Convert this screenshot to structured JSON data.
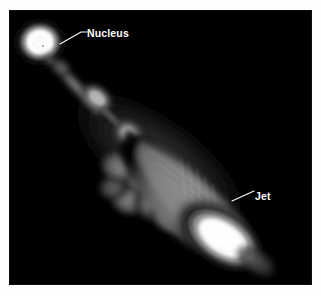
{
  "figure": {
    "kind": "radio-astronomy-image",
    "background_color": "#ffffff",
    "plate_color": "#000000",
    "annotation_color": "#ffffff"
  },
  "annotations": [
    {
      "id": "nucleus",
      "label": "Nucleus",
      "leader_from_x": 51,
      "leader_from_y": 34,
      "leader_to_x": 76,
      "leader_to_y": 21
    },
    {
      "id": "jet",
      "label": "Jet",
      "leader_from_x": 223,
      "leader_from_y": 191,
      "leader_to_x": 244,
      "leader_to_y": 181
    }
  ],
  "features": {
    "nucleus": {
      "label": "Nucleus",
      "cx": 31,
      "cy": 32
    },
    "jet": {
      "label": "Jet",
      "cx": 214,
      "cy": 228
    }
  }
}
